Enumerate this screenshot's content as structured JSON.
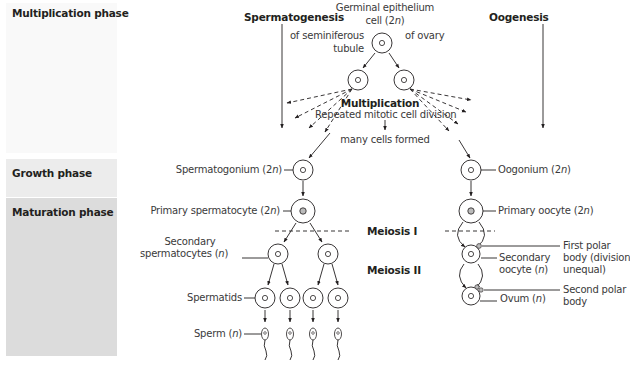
{
  "phases": {
    "multiplication": "Multiplication phase",
    "growth": "Growth phase",
    "maturation": "Maturation phase"
  },
  "headers": {
    "left": "Spermatogenesis",
    "right": "Oogenesis"
  },
  "top": {
    "germinal_line1": "Germinal epithelium",
    "germinal_line2": "cell (2n)",
    "of_seminiferous_line1": "of seminiferous",
    "of_seminiferous_line2": "tubule",
    "of_ovary": "of ovary"
  },
  "multiplication": {
    "title": "Multiplication",
    "subtitle": "Repeated mitotic cell division",
    "result": "many cells formed"
  },
  "sperm_labels": {
    "spermatogonium": "Spermatogonium (2n)",
    "primary": "Primary spermatocyte (2n)",
    "secondary_line1": "Secondary",
    "secondary_line2": "spermatocytes (n)",
    "spermatids": "Spermatids",
    "sperm": "Sperm (n)"
  },
  "meiosis": {
    "one": "Meiosis I",
    "two": "Meiosis II"
  },
  "oo_labels": {
    "oogonium": "Oogonium (2n)",
    "primary": "Primary oocyte (2n)",
    "secondary_line1": "Secondary",
    "secondary_line2": "oocyte (n)",
    "ovum": "Ovum (n)",
    "first_polar_line1": "First polar",
    "first_polar_line2": "body (division",
    "first_polar_line3": "unequal)",
    "second_polar_line1": "Second polar",
    "second_polar_line2": "body"
  },
  "colors": {
    "ink": "#231f20",
    "panel_multiplication": "#f9f9f9",
    "panel_growth": "#ececec",
    "panel_maturation": "#dcdcdc"
  }
}
